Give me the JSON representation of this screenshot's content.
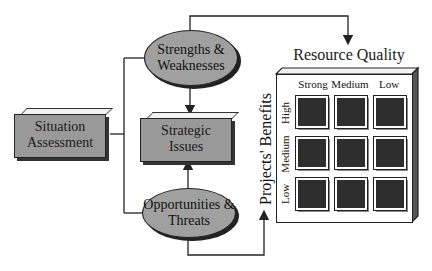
{
  "diagram": {
    "nodes": {
      "situation_assessment": "Situation Assessment",
      "strengths_weaknesses": "Strengths & Weaknesses",
      "strategic_issues": "Strategic Issues",
      "opportunities_threats": "Opportunities & Threats"
    },
    "matrix": {
      "title": "Resource Quality",
      "y_title": "Projects' Benefits",
      "columns": [
        "Strong",
        "Medium",
        "Low"
      ],
      "rows": [
        "High",
        "Medium",
        "Low"
      ]
    },
    "colors": {
      "node_fill": "#999999",
      "cell_fill": "#2e2e2e",
      "line": "#222222"
    }
  }
}
